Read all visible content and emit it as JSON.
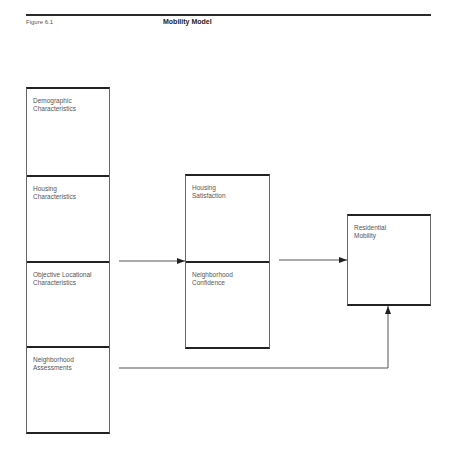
{
  "header": {
    "figure_number": "Figure 6.1",
    "title": "Mobility Model"
  },
  "diagram": {
    "input_factors": [
      {
        "line1": "Demographic",
        "line2": "Characteristics"
      },
      {
        "line1": "Housing",
        "line2": "Characteristics"
      },
      {
        "line1": "Objective Locational",
        "line2": "Characteristics"
      },
      {
        "line1": "Neighborhood",
        "line2": "Assessments"
      }
    ],
    "intermediate_factors": [
      {
        "line1": "Housing",
        "line2": "Satisfaction"
      },
      {
        "line1": "Neighborhood",
        "line2": "Confidence"
      }
    ],
    "outcome": {
      "line1": "Residential",
      "line2": "Mobility"
    },
    "connections": [
      {
        "from": "input_factors",
        "to": "intermediate_factors"
      },
      {
        "from": "intermediate_factors",
        "to": "outcome"
      },
      {
        "from": "Neighborhood Assessments",
        "to": "outcome"
      }
    ]
  }
}
